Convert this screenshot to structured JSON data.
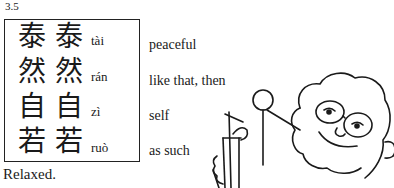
{
  "section_number": "3.5",
  "entries": [
    {
      "trad": "泰",
      "simp": "泰",
      "pinyin": "tài",
      "gloss": "peaceful"
    },
    {
      "trad": "然",
      "simp": "然",
      "pinyin": "rán",
      "gloss": "like that, then"
    },
    {
      "trad": "自",
      "simp": "自",
      "pinyin": "zì",
      "gloss": "self"
    },
    {
      "trad": "若",
      "simp": "若",
      "pinyin": "ruò",
      "gloss": "as such"
    }
  ],
  "caption": "Relaxed.",
  "illustration": "cartoon-person-with-drink"
}
